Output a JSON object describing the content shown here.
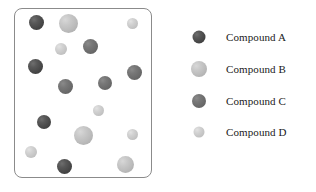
{
  "figure": {
    "container": {
      "name": "mixture-container",
      "border_color": "#8b8b8b",
      "background": "#ffffff"
    },
    "compound_colors": {
      "A": "#494949",
      "B": "#bcbcbc",
      "C": "#6c6c6c",
      "D": "#c6c6c6"
    },
    "particles": [
      {
        "compound": "A",
        "x": 35,
        "y": 21,
        "d": 15
      },
      {
        "compound": "B",
        "x": 67,
        "y": 22,
        "d": 19
      },
      {
        "compound": "D",
        "x": 131,
        "y": 22,
        "d": 11
      },
      {
        "compound": "D",
        "x": 60,
        "y": 48,
        "d": 12
      },
      {
        "compound": "C",
        "x": 89,
        "y": 45,
        "d": 15
      },
      {
        "compound": "A",
        "x": 34,
        "y": 65,
        "d": 15
      },
      {
        "compound": "C",
        "x": 133,
        "y": 71,
        "d": 15
      },
      {
        "compound": "C",
        "x": 64,
        "y": 85,
        "d": 15
      },
      {
        "compound": "C",
        "x": 104,
        "y": 82,
        "d": 14
      },
      {
        "compound": "D",
        "x": 97,
        "y": 109,
        "d": 11
      },
      {
        "compound": "A",
        "x": 43,
        "y": 121,
        "d": 14
      },
      {
        "compound": "B",
        "x": 82,
        "y": 134,
        "d": 19
      },
      {
        "compound": "D",
        "x": 131,
        "y": 133,
        "d": 11
      },
      {
        "compound": "D",
        "x": 30,
        "y": 151,
        "d": 12
      },
      {
        "compound": "A",
        "x": 63,
        "y": 165,
        "d": 15
      },
      {
        "compound": "B",
        "x": 124,
        "y": 163,
        "d": 17
      }
    ]
  },
  "legend": {
    "items": [
      {
        "label": "Compound A",
        "compound": "A",
        "swatch_d": 13,
        "y": 0
      },
      {
        "label": "Compound B",
        "compound": "B",
        "swatch_d": 16,
        "y": 32
      },
      {
        "label": "Compound C",
        "compound": "C",
        "swatch_d": 14,
        "y": 64
      },
      {
        "label": "Compound D",
        "compound": "D",
        "swatch_d": 11,
        "y": 95
      }
    ]
  }
}
